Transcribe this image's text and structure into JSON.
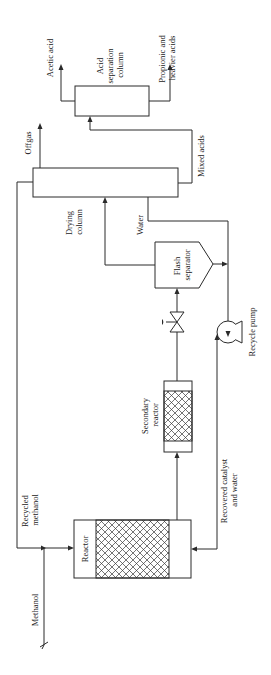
{
  "diagram": {
    "type": "process-flow",
    "orientation": "rotated-90-ccw",
    "units": {
      "acid_separation_column": {
        "label_lines": [
          "Acid",
          "separation",
          "column"
        ]
      },
      "drying_column": {
        "label_lines": [
          "Drying",
          "column"
        ]
      },
      "flash_separator": {
        "label_lines": [
          "Flash",
          "separator"
        ]
      },
      "secondary_reactor": {
        "label_lines": [
          "Secondary",
          "reactor"
        ]
      },
      "reactor": {
        "label": "Reactor"
      },
      "recycle_pump": {
        "label": "Recycle pump"
      },
      "valve": {
        "label": ""
      }
    },
    "streams": {
      "acetic_acid": {
        "label": "Acetic acid"
      },
      "propionic": {
        "label_lines": [
          "Propionic and",
          "heavier acids"
        ]
      },
      "offgas": {
        "label": "Offgas"
      },
      "mixed_acids": {
        "label": "Mixed acids"
      },
      "water": {
        "label": "Water"
      },
      "recycled_methanol": {
        "label_lines": [
          "Recycled",
          "methanol"
        ]
      },
      "recovered_catalyst": {
        "label_lines": [
          "Recovered catalyst",
          "and water"
        ]
      },
      "methanol": {
        "label": "Methanol"
      }
    },
    "connections": [
      {
        "from": "Methanol feed",
        "to": "Reactor"
      },
      {
        "from": "Drying column",
        "to": "Reactor",
        "stream": "Recycled methanol"
      },
      {
        "from": "Reactor",
        "to": "Secondary reactor"
      },
      {
        "from": "Secondary reactor",
        "to": "Valve"
      },
      {
        "from": "Valve",
        "to": "Flash separator"
      },
      {
        "from": "Flash separator",
        "to": "Drying column"
      },
      {
        "from": "Flash separator",
        "to": "Recycle pump"
      },
      {
        "from": "Drying column",
        "to": "Recycle pump",
        "stream": "Water"
      },
      {
        "from": "Recycle pump",
        "to": "Reactor",
        "stream": "Recovered catalyst and water"
      },
      {
        "from": "Drying column",
        "to": "Offgas"
      },
      {
        "from": "Drying column",
        "to": "Acid separation column",
        "stream": "Mixed acids"
      },
      {
        "from": "Acid separation column",
        "to": "Acetic acid"
      },
      {
        "from": "Acid separation column",
        "to": "Propionic and heavier acids"
      }
    ]
  }
}
